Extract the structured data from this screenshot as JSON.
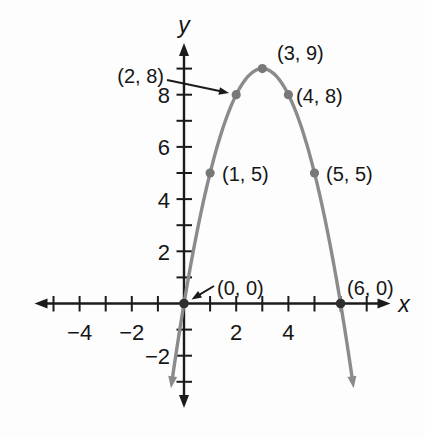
{
  "figure": {
    "background": "#fdfdfd",
    "colors": {
      "axis": "#1b1b1b",
      "curve": "#8b8b8b",
      "point": "#787878",
      "intercept_point": "#2f2f2f",
      "text": "#161616"
    }
  },
  "chart_data": {
    "type": "line",
    "curve": "parabola",
    "title": "",
    "vertex": [
      3,
      9
    ],
    "x_intercepts": [
      [
        0,
        0
      ],
      [
        6,
        0
      ]
    ],
    "points": [
      {
        "x": 0,
        "y": 0,
        "label": "(0, 0)",
        "dot": "dark",
        "leader_arrow": true
      },
      {
        "x": 1,
        "y": 5,
        "label": "(1, 5)",
        "dot": "gray",
        "leader_arrow": false
      },
      {
        "x": 2,
        "y": 8,
        "label": "(2, 8)",
        "dot": "gray",
        "leader_arrow": true
      },
      {
        "x": 3,
        "y": 9,
        "label": "(3, 9)",
        "dot": "gray",
        "leader_arrow": false
      },
      {
        "x": 4,
        "y": 8,
        "label": "(4, 8)",
        "dot": "gray",
        "leader_arrow": false
      },
      {
        "x": 5,
        "y": 5,
        "label": "(5, 5)",
        "dot": "gray",
        "leader_arrow": false
      },
      {
        "x": 6,
        "y": 0,
        "label": "(6, 0)",
        "dot": "dark",
        "leader_arrow": false
      }
    ],
    "xlabel": "x",
    "ylabel": "y",
    "x_axis": {
      "tick_positions": [
        -5,
        -4,
        -3,
        -2,
        -1,
        1,
        2,
        3,
        4,
        5,
        6,
        7
      ],
      "labels": [
        {
          "value": -4,
          "text": "−4"
        },
        {
          "value": -2,
          "text": "−2"
        },
        {
          "value": 2,
          "text": "2"
        },
        {
          "value": 4,
          "text": "4"
        }
      ],
      "range": [
        -5.7,
        7.9
      ]
    },
    "y_axis": {
      "tick_positions": [
        -3,
        -2,
        -1,
        1,
        2,
        3,
        4,
        5,
        6,
        7,
        8,
        9
      ],
      "labels": [
        {
          "value": 8,
          "text": "8"
        },
        {
          "value": 6,
          "text": "6"
        },
        {
          "value": 4,
          "text": "4"
        },
        {
          "value": 2,
          "text": "2"
        },
        {
          "value": -2,
          "text": "−2"
        }
      ],
      "range": [
        -3.9,
        9.9
      ]
    },
    "grid": false,
    "curve_x_range": [
      -0.45,
      6.45
    ]
  }
}
